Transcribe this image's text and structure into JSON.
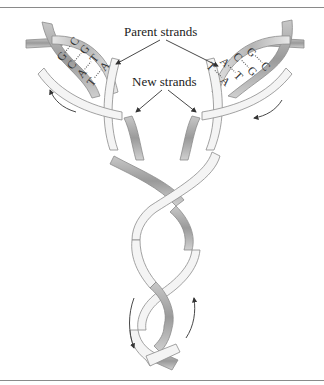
{
  "figure": {
    "labels": {
      "parent_strands": "Parent strands",
      "new_strands": "New strands"
    },
    "left_fork_base_pairs": [
      {
        "left": "G",
        "right": "C"
      },
      {
        "left": "C",
        "right": "G"
      },
      {
        "left": "A",
        "right": "T"
      },
      {
        "left": "T",
        "right": "A"
      }
    ],
    "right_fork_base_pairs": [
      {
        "left": "G",
        "right": "C"
      },
      {
        "left": "C",
        "right": "G"
      },
      {
        "left": "A",
        "right": "T"
      },
      {
        "left": "T",
        "right": "A"
      }
    ],
    "colors": {
      "ribbon_light": "#f4f4f4",
      "ribbon_shade": "#a8a8a8",
      "outline": "#8c8c8c",
      "text": "#222222",
      "rule": "#8a8a8a"
    }
  }
}
